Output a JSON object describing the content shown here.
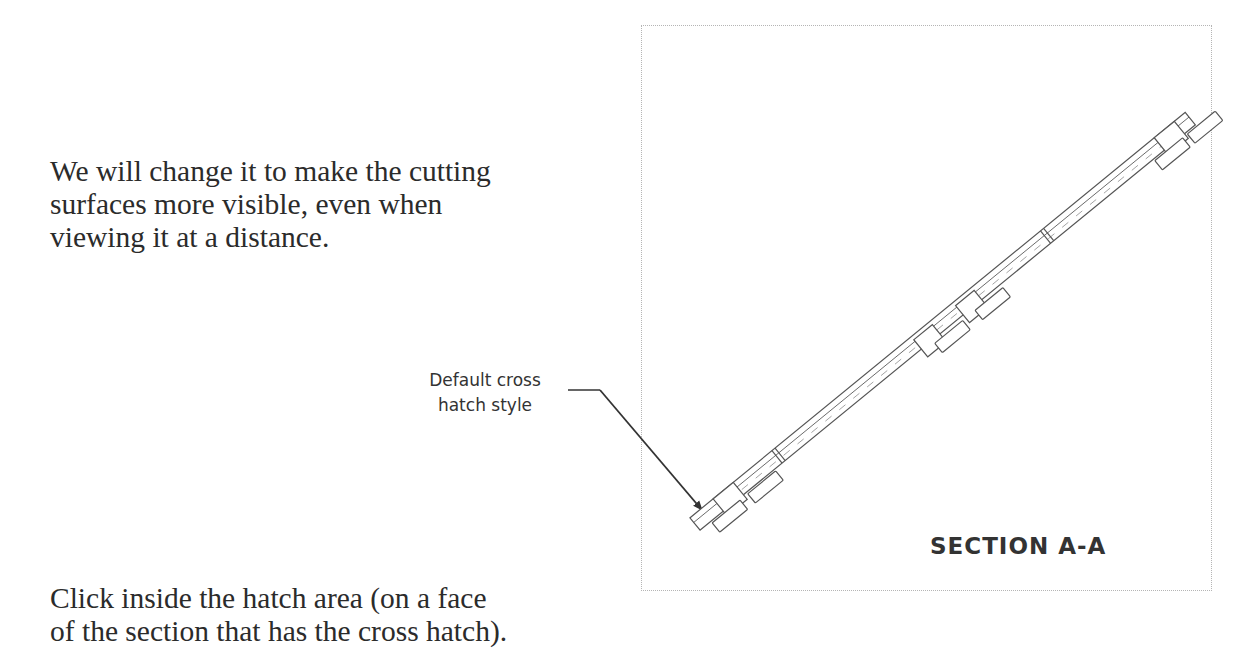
{
  "document": {
    "paragraph_top": {
      "lines": [
        "We will change it to make the cutting",
        "surfaces more visible, even when",
        "viewing it at a distance."
      ]
    },
    "paragraph_bottom": {
      "lines": [
        "Click inside the hatch area (on a face",
        "of the section that has the cross hatch)."
      ]
    }
  },
  "figure": {
    "callout": {
      "lines": [
        "Default cross",
        "hatch style"
      ]
    },
    "section_label": "SECTION A-A",
    "colors": {
      "line": "#555555",
      "frame": "#b5b5b5",
      "text": "#333333"
    }
  }
}
